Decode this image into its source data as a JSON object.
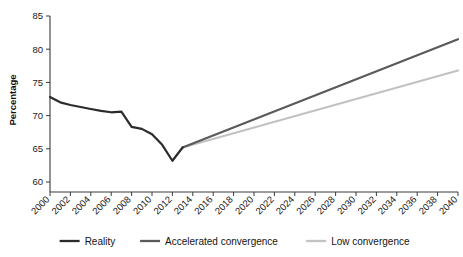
{
  "chart_data": {
    "type": "line",
    "title": "",
    "xlabel": "",
    "ylabel": "Percentage",
    "ylim": [
      60,
      85
    ],
    "xlim": [
      2000,
      2040
    ],
    "ytick_labels": [
      "60",
      "65",
      "70",
      "75",
      "80",
      "85"
    ],
    "yticks": [
      60,
      65,
      70,
      75,
      80,
      85
    ],
    "xtick_labels": [
      "2000",
      "2002",
      "2004",
      "2006",
      "2008",
      "2010",
      "2012",
      "2014",
      "2016",
      "2018",
      "2020",
      "2022",
      "2024",
      "2026",
      "2028",
      "2030",
      "2032",
      "2034",
      "2036",
      "2038",
      "2040"
    ],
    "xticks": [
      2000,
      2002,
      2004,
      2006,
      2008,
      2010,
      2012,
      2014,
      2016,
      2018,
      2020,
      2022,
      2024,
      2026,
      2028,
      2030,
      2032,
      2034,
      2036,
      2038,
      2040
    ],
    "grid": false,
    "legend_position": "bottom",
    "series": [
      {
        "name": "Reality",
        "color": "#2b2b2b",
        "width": 2.2,
        "x": [
          2000,
          2001,
          2002,
          2003,
          2004,
          2005,
          2006,
          2007,
          2008,
          2009,
          2010,
          2011,
          2012,
          2013
        ],
        "values": [
          72.8,
          72.0,
          71.6,
          71.3,
          71.0,
          70.7,
          70.5,
          70.6,
          68.3,
          68.0,
          67.2,
          65.6,
          63.2,
          65.2
        ]
      },
      {
        "name": "Accelerated convergence",
        "color": "#5a5a5a",
        "width": 2.2,
        "x": [
          2013,
          2040
        ],
        "values": [
          65.2,
          81.5
        ]
      },
      {
        "name": "Low convergence",
        "color": "#c2c2c2",
        "width": 2.2,
        "x": [
          2013,
          2040
        ],
        "values": [
          65.2,
          76.8
        ]
      }
    ]
  },
  "legend": {
    "items": [
      {
        "label": "Reality",
        "color": "#2b2b2b"
      },
      {
        "label": "Accelerated convergence",
        "color": "#5a5a5a"
      },
      {
        "label": "Low convergence",
        "color": "#c2c2c2"
      }
    ]
  },
  "axes": {
    "y_axis_title": "Percentage"
  }
}
